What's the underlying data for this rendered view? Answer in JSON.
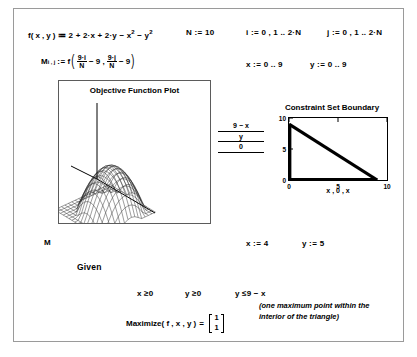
{
  "document": {
    "type": "mathcad-worksheet"
  },
  "definitions": {
    "objective": {
      "name": "f",
      "args": "( x , y )",
      "assign": ":=",
      "body_a": "2 + 2",
      "body_dot": "·",
      "body_x": "x + 2",
      "body_y": "y − x",
      "exp2a": "2",
      "body_minus_y": "− y",
      "exp2b": "2",
      "full": "f(x,y) := 2 + 2·x + 2·y − x² − y²"
    },
    "N": {
      "label": "N",
      "assign": ":=",
      "value": "10"
    },
    "i": {
      "label": "i",
      "assign": ":=",
      "value": "0 , 1 .. 2·N"
    },
    "j": {
      "label": "j",
      "assign": ":=",
      "value": "0 , 1 .. 2·N"
    },
    "matrix": {
      "symbol": "M",
      "subscript": "i , j",
      "assign": ":=",
      "func": "f",
      "num1": "9·i",
      "den1": "N",
      "term1_tail": "− 9 ,",
      "num2": "9·j",
      "den2": "N",
      "term2_tail": "− 9",
      "paren_open": "(",
      "paren_close": ")",
      "full": "M(i,j) := f( 9·i/N − 9 , 9·j/N − 9 )"
    },
    "x_range": {
      "label": "x",
      "assign": ":=",
      "value": "0 .. 9"
    },
    "y_range": {
      "label": "y",
      "assign": ":=",
      "value": "0 .. 9"
    },
    "x_guess": {
      "label": "x",
      "assign": ":=",
      "value": "4"
    },
    "y_guess": {
      "label": "y",
      "assign": ":=",
      "value": "5"
    },
    "matrix_ref": "M"
  },
  "surface_plot": {
    "title": "Objective Function Plot",
    "plotted_variable": "M",
    "description": "3D wireframe paraboloid dome surface"
  },
  "constraint_plot": {
    "title": "Constraint Set Boundary",
    "x_axis_label": "x , 0 , x",
    "y_axis_traces": [
      "9 − x",
      "y",
      "0"
    ],
    "x_ticks": [
      "0",
      "5",
      "10"
    ],
    "y_ticks": [
      "0",
      "5",
      "10"
    ],
    "xlim": [
      0,
      10
    ],
    "ylim": [
      0,
      10
    ]
  },
  "chart_data": {
    "type": "line",
    "title": "Constraint Set Boundary",
    "xlabel": "x , 0 , x",
    "ylabel": "9 − x / y / 0",
    "xlim": [
      0,
      10
    ],
    "ylim": [
      0,
      10
    ],
    "x_ticks": [
      0,
      5,
      10
    ],
    "y_ticks": [
      0,
      5,
      10
    ],
    "grid": false,
    "legend": "none",
    "series": [
      {
        "name": "9 − x",
        "x": [
          0,
          9
        ],
        "values": [
          9,
          0
        ]
      },
      {
        "name": "y",
        "x": [
          0,
          0
        ],
        "values": [
          0,
          9
        ]
      },
      {
        "name": "0",
        "x": [
          0,
          9
        ],
        "values": [
          0,
          0
        ]
      }
    ],
    "annotation": "Triangular feasible region bounded by x≥0, y≥0, y≤9−x"
  },
  "solve_block": {
    "given_label": "Given",
    "constraints": [
      {
        "text": "x ≥0"
      },
      {
        "text": "y ≥0"
      },
      {
        "text": "y ≤9 − x"
      }
    ],
    "maximize": {
      "name": "Maximize",
      "args": "( f , x , y )",
      "equals": "=",
      "result": [
        "1",
        "1"
      ]
    },
    "note": "(one maximum point within the interior of the triangle)"
  },
  "colors": {
    "ink": "#000000",
    "page": "#ffffff",
    "border": "#9a9a9a",
    "plot_border": "#5b5b5b"
  }
}
